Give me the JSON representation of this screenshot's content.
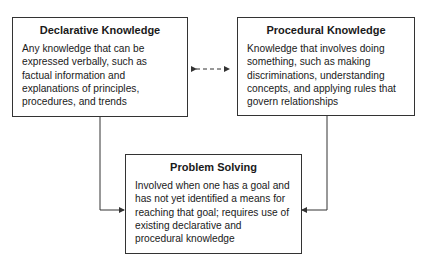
{
  "nodes": [
    {
      "id": "declarative",
      "title": "Declarative Knowledge",
      "description": "Any knowledge that can be expressed verbally, such as factual information and explanations of principles, procedures, and trends"
    },
    {
      "id": "procedural",
      "title": "Procedural Knowledge",
      "description": "Knowledge that involves doing something, such as making discriminations, understanding concepts, and applying rules that govern relationships"
    },
    {
      "id": "problem",
      "title": "Problem Solving",
      "description": "Involved when one has a goal and has not yet identified a means for reaching that goal; requires use of existing declarative and procedural knowledge"
    }
  ],
  "edges": [
    {
      "from": "declarative",
      "to": "procedural",
      "style": "dashed",
      "direction": "both"
    },
    {
      "from": "declarative",
      "to": "problem",
      "style": "solid",
      "direction": "forward"
    },
    {
      "from": "procedural",
      "to": "problem",
      "style": "solid",
      "direction": "forward"
    }
  ]
}
